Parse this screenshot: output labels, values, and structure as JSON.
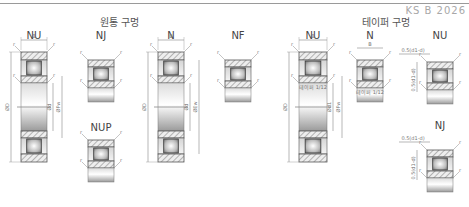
{
  "header": {
    "standard": "KS B 2026"
  },
  "groups": {
    "cylindrical_bore": "원통 구멍",
    "tapered_bore": "테이퍼 구멍"
  },
  "bearings": [
    {
      "type": "NU",
      "group": "cylindrical_bore"
    },
    {
      "type": "NJ",
      "group": "cylindrical_bore"
    },
    {
      "type": "NUP",
      "group": "cylindrical_bore"
    },
    {
      "type": "N",
      "group": "cylindrical_bore"
    },
    {
      "type": "NF",
      "group": "cylindrical_bore"
    },
    {
      "type": "NU",
      "group": "tapered_bore"
    },
    {
      "type": "N",
      "group": "tapered_bore"
    },
    {
      "type": "NU",
      "group": "tapered_bore"
    },
    {
      "type": "NJ",
      "group": "tapered_bore"
    }
  ],
  "dimensions": {
    "width": "B",
    "chamfer": "r",
    "outer_diameter": "ØD",
    "bore_diameter": "Ød",
    "inner_raceway_dia": "ØFw",
    "outer_raceway_dia": "ØEw",
    "tapered_bore_dia": "Ød1",
    "taper_1_12": "테이퍼 1/12",
    "offset_label": "0.5(d1-d)"
  }
}
